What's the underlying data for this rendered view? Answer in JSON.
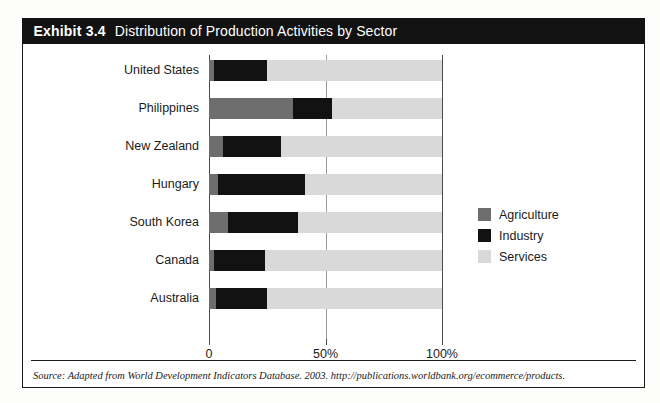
{
  "exhibit": {
    "number": "Exhibit 3.4",
    "title": "Distribution of Production Activities by Sector",
    "source": "Source: Adapted from World Development Indicators Database. 2003. http://publications.worldbank.org/ecommerce/products."
  },
  "legend": {
    "items": [
      {
        "label": "Agriculture",
        "color": "#6e6e6e"
      },
      {
        "label": "Industry",
        "color": "#121212"
      },
      {
        "label": "Services",
        "color": "#d9d9d9"
      }
    ]
  },
  "axis": {
    "ticks": [
      {
        "label": "0",
        "value": 0
      },
      {
        "label": "50%",
        "value": 50
      },
      {
        "label": "100%",
        "value": 100
      }
    ]
  },
  "chart_data": {
    "type": "bar",
    "orientation": "horizontal",
    "stacked": true,
    "title": "Distribution of Production Activities by Sector",
    "xlabel": "",
    "ylabel": "",
    "xlim": [
      0,
      100
    ],
    "grid": true,
    "legend_position": "right",
    "categories": [
      "United States",
      "Philippines",
      "New Zealand",
      "Hungary",
      "South Korea",
      "Canada",
      "Australia"
    ],
    "series": [
      {
        "name": "Agriculture",
        "color": "#6e6e6e",
        "values": [
          2,
          36,
          6,
          4,
          8,
          2,
          3
        ]
      },
      {
        "name": "Industry",
        "color": "#121212",
        "values": [
          23,
          17,
          25,
          37,
          30,
          22,
          22
        ]
      },
      {
        "name": "Services",
        "color": "#d9d9d9",
        "values": [
          75,
          47,
          69,
          59,
          62,
          76,
          75
        ]
      }
    ]
  }
}
